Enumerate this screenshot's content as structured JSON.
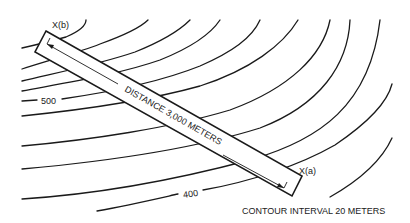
{
  "diagram": {
    "type": "contour-map",
    "bar_label": "DISTANCE 3,000 METERS",
    "point_a_label": "X(a)",
    "point_b_label": "X(b)",
    "contour_labels": [
      {
        "text": "500",
        "x": 42,
        "y": 101
      },
      {
        "text": "400",
        "x": 185,
        "y": 194
      }
    ],
    "caption": "CONTOUR INTERVAL 20 METERS",
    "distance_meters": 3000,
    "contour_interval_meters": 20,
    "colors": {
      "line": "#1a1a1a",
      "background": "#ffffff"
    }
  }
}
